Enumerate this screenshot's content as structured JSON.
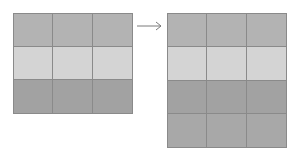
{
  "diagram": {
    "colors": {
      "row_medium": "#b3b3b3",
      "row_light": "#d4d4d4",
      "row_dark": "#a2a2a2",
      "grid_line": "#8a8a8a",
      "arrow": "#7a7a7a"
    },
    "left_grid": {
      "rows": 3,
      "cols": 3,
      "row_colors": [
        "#b3b3b3",
        "#d4d4d4",
        "#a2a2a2"
      ]
    },
    "arrow": {
      "direction": "right"
    },
    "right_grid": {
      "rows": 4,
      "cols": 3,
      "row_colors": [
        "#b3b3b3",
        "#d4d4d4",
        "#a2a2a2",
        "#a8a8a8"
      ]
    }
  }
}
